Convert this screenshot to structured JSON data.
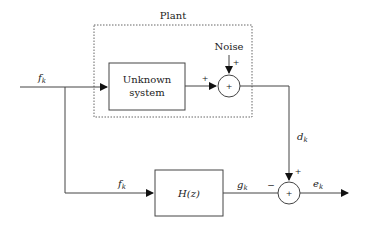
{
  "diagram": {
    "plant_label": "Plant",
    "noise_label": "Noise",
    "unknown_system": {
      "line1": "Unknown",
      "line2": "system"
    },
    "filter_label": "H(z)",
    "signals": {
      "input_top": {
        "base": "f",
        "sub": "k"
      },
      "input_bottom": {
        "base": "f",
        "sub": "k"
      },
      "desired": {
        "base": "d",
        "sub": "k"
      },
      "filter_output": {
        "base": "g",
        "sub": "k"
      },
      "error": {
        "base": "e",
        "sub": "k"
      }
    },
    "signs": {
      "top_sum_left": "+",
      "top_sum_noise": "+",
      "top_sum_center": "+",
      "bottom_sum_top": "+",
      "bottom_sum_left": "−",
      "bottom_sum_center": "+"
    },
    "colors": {
      "line": "#444444",
      "dotted": "#666666",
      "text": "#222222"
    }
  }
}
